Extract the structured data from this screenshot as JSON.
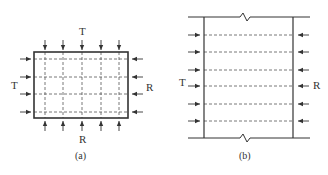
{
  "panels": [
    {
      "id": "a",
      "caption": "(a)",
      "labels": {
        "top": "T",
        "left": "T",
        "right": "R",
        "bottom": "R"
      },
      "rect": {
        "x": 34,
        "y": 52,
        "w": 94,
        "h": 66
      },
      "vertical_dashed_x": [
        45,
        63,
        82,
        101,
        119
      ],
      "horizontal_dashed_y": [
        59,
        77,
        94,
        112
      ]
    },
    {
      "id": "b",
      "caption": "(b)",
      "labels": {
        "left": "T",
        "right": "R"
      },
      "walls_x": [
        204,
        293
      ],
      "top_y": 17,
      "bottom_y": 138,
      "horizontal_dashed_y": [
        35,
        52,
        70,
        86,
        104,
        121
      ]
    }
  ],
  "colors": {
    "line": "#333333",
    "dash": "#555555"
  }
}
